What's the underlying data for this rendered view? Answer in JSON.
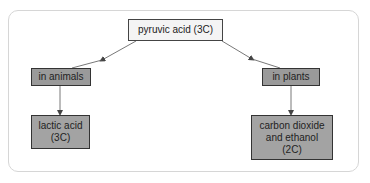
{
  "diagram": {
    "type": "flowchart",
    "root": {
      "label": "pyruvic acid (3C)"
    },
    "branches": [
      {
        "label": "in animals",
        "product": "lactic acid\n(3C)"
      },
      {
        "label": "in plants",
        "product": "carbon dioxide\nand ethanol\n(2C)"
      }
    ],
    "colors": {
      "frame_border": "#d6d6d6",
      "root_fill": "#f4f4f4",
      "branch_fill": "#9a9a9a",
      "result_fill": "#a3a3a3",
      "line": "#555555"
    }
  }
}
